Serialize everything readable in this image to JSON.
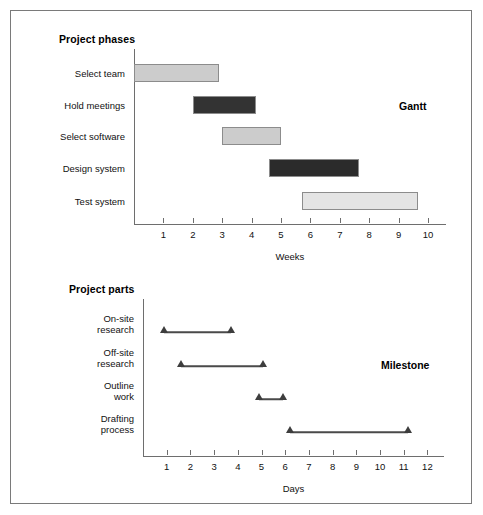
{
  "figure": {
    "background": "#ffffff",
    "border_color": "#7a7a7a"
  },
  "chart_data": [
    {
      "type": "bar",
      "chart_id": "gantt",
      "title": "Project phases",
      "annotation": "Gantt",
      "xlabel": "Weeks",
      "ylabel": "",
      "orientation": "horizontal",
      "xlim": [
        0,
        10.6
      ],
      "xticks": [
        1,
        2,
        3,
        4,
        5,
        6,
        7,
        8,
        9,
        10
      ],
      "xtick_labels": [
        "1",
        "2",
        "3",
        "4",
        "5",
        "6",
        "7",
        "8",
        "9",
        "10"
      ],
      "grid": false,
      "legend": "none",
      "categories": [
        "Select team",
        "Hold meetings",
        "Select software",
        "Design system",
        "Test system"
      ],
      "tasks": [
        {
          "label": "Select team",
          "start": 0.0,
          "end": 2.9,
          "fill": "#cccccc",
          "stroke": "#8c8c8c"
        },
        {
          "label": "Hold meetings",
          "start": 2.0,
          "end": 4.15,
          "fill": "#333333",
          "stroke": "#8c8c8c"
        },
        {
          "label": "Select software",
          "start": 3.0,
          "end": 5.0,
          "fill": "#cccccc",
          "stroke": "#8c8c8c"
        },
        {
          "label": "Design system",
          "start": 4.6,
          "end": 7.65,
          "fill": "#2b2b2b",
          "stroke": "#8c8c8c"
        },
        {
          "label": "Test system",
          "start": 5.7,
          "end": 9.65,
          "fill": "#e4e4e4",
          "stroke": "#8c8c8c"
        }
      ]
    },
    {
      "type": "line",
      "chart_id": "milestone",
      "title": "Project parts",
      "annotation": "Milestone",
      "xlabel": "Days",
      "ylabel": "",
      "orientation": "horizontal",
      "xlim": [
        0,
        12.7
      ],
      "xticks": [
        1,
        2,
        3,
        4,
        5,
        6,
        7,
        8,
        9,
        10,
        11,
        12
      ],
      "xtick_labels": [
        "1",
        "2",
        "3",
        "4",
        "5",
        "6",
        "7",
        "8",
        "9",
        "10",
        "11",
        "12"
      ],
      "grid": false,
      "legend": "none",
      "marker": "triangle-up",
      "marker_color": "#3d3d3d",
      "line_color": "#4a4a4a",
      "categories": [
        "On-site\nresearch",
        "Off-site\nresearch",
        "Outline\nwork",
        "Drafting\nprocess"
      ],
      "tasks": [
        {
          "label": "On-site\nresearch",
          "start": 0.9,
          "end": 3.7
        },
        {
          "label": "Off-site\nresearch",
          "start": 1.6,
          "end": 5.05
        },
        {
          "label": "Outline\nwork",
          "start": 4.9,
          "end": 5.9
        },
        {
          "label": "Drafting\nprocess",
          "start": 6.2,
          "end": 11.2
        }
      ]
    }
  ]
}
